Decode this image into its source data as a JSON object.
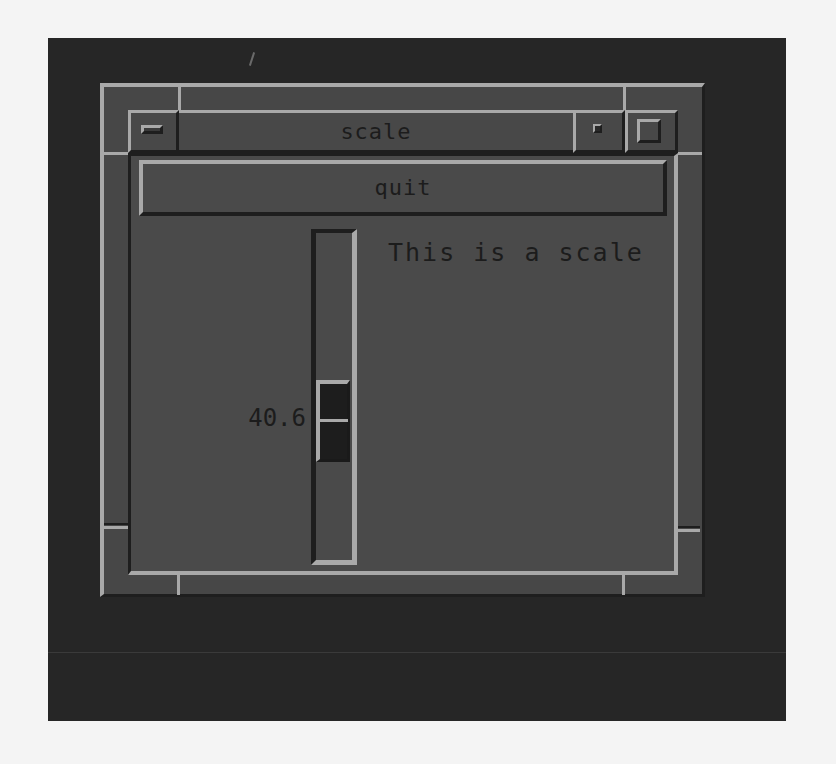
{
  "window": {
    "title": "scale",
    "buttons": {
      "menu_icon": "window-menu-icon",
      "minimize_icon": "minimize-icon",
      "maximize_icon": "maximize-icon"
    }
  },
  "client": {
    "quit_button": {
      "label": "quit"
    },
    "scale": {
      "label": "This is a scale",
      "value": "40.6",
      "orientation": "vertical"
    }
  },
  "colors": {
    "desktop": "#262626",
    "frame": "#474747",
    "highlight": "#a9a9a9",
    "shadow": "#1e1e1e",
    "client_bg": "#4a4a4a",
    "text": "#1c1c1c",
    "thumb": "#1d1d1d"
  }
}
